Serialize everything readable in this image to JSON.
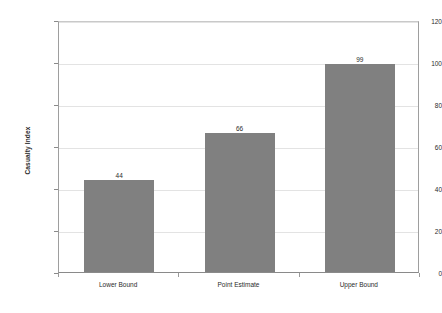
{
  "chart_data": {
    "type": "bar",
    "title": "",
    "subtitle": "",
    "xlabel": "",
    "ylabel": "Casualty Index",
    "categories": [
      "Lower Bound",
      "Point Estimate",
      "Upper Bound"
    ],
    "values": [
      44,
      66,
      99
    ],
    "data_labels": [
      "44",
      "66",
      "99"
    ],
    "ylim": [
      0,
      120
    ],
    "ytick_labels": [
      "0",
      "20",
      "40",
      "60",
      "80",
      "100",
      "120"
    ],
    "ytick_values": [
      0,
      20,
      40,
      60,
      80,
      100,
      120
    ],
    "grid": true,
    "legend": "none",
    "bar_color": "#808080",
    "gridline_color": "#e3e3e3",
    "axis_color": "#8a8a8a",
    "text_color": "#2b2b2b",
    "background_color": "#ffffff"
  }
}
